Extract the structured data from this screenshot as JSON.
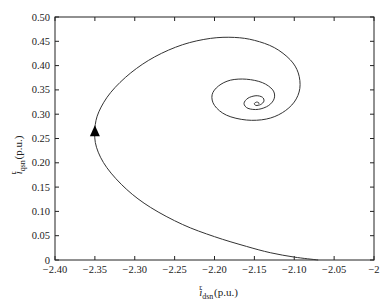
{
  "chart_data": {
    "type": "line",
    "title": "",
    "xlabel": "i^r_dsn(p.u.)",
    "xlabel_main": "i",
    "xlabel_sup": "r",
    "xlabel_sub": "dsn",
    "xlabel_unit": "(p.u.)",
    "ylabel": "i^r_qsn(p.u.)",
    "ylabel_main": "i",
    "ylabel_sup": "r",
    "ylabel_sub": "qsn",
    "ylabel_unit": "(p.u.)",
    "xlim": [
      -2.4,
      -2.0
    ],
    "ylim": [
      0,
      0.5
    ],
    "grid": false,
    "legend": null,
    "x_ticks": [
      -2.4,
      -2.35,
      -2.3,
      -2.25,
      -2.2,
      -2.15,
      -2.1,
      -2.05,
      -2.0
    ],
    "x_tick_labels": [
      "−2.40",
      "−2.35",
      "−2.30",
      "−2.25",
      "−2.20",
      "−2.15",
      "−2.10",
      "−2.05",
      "−2"
    ],
    "y_ticks": [
      0,
      0.05,
      0.1,
      0.15,
      0.2,
      0.25,
      0.3,
      0.35,
      0.4,
      0.45,
      0.5
    ],
    "y_tick_labels": [
      "0",
      "0.05",
      "0.10",
      "0.15",
      "0.20",
      "0.25",
      "0.30",
      "0.35",
      "0.40",
      "0.45",
      "0.50"
    ],
    "series": [
      {
        "name": "trajectory",
        "description": "Spiral trajectory starting near (-2.07, 0) and converging to approx (-2.145, 0.32)",
        "start_point": [
          -2.07,
          0.0
        ],
        "end_point": [
          -2.145,
          0.32
        ],
        "arrow_marker": {
          "x": -2.35,
          "y": 0.265,
          "direction": "up"
        },
        "x": [
          -2.07,
          -2.1,
          -2.13,
          -2.16,
          -2.2,
          -2.24,
          -2.28,
          -2.31,
          -2.335,
          -2.348,
          -2.35,
          -2.345,
          -2.33,
          -2.305,
          -2.275,
          -2.24,
          -2.205,
          -2.175,
          -2.15,
          -2.125,
          -2.105,
          -2.095,
          -2.093,
          -2.1,
          -2.115,
          -2.135,
          -2.16,
          -2.185,
          -2.2,
          -2.203,
          -2.195,
          -2.18,
          -2.16,
          -2.14,
          -2.127,
          -2.125,
          -2.132,
          -2.145,
          -2.158,
          -2.163,
          -2.158,
          -2.148,
          -2.14,
          -2.138,
          -2.142,
          -2.148,
          -2.15,
          -2.147,
          -2.144,
          -2.145
        ],
        "y": [
          0.0,
          0.006,
          0.015,
          0.028,
          0.048,
          0.073,
          0.108,
          0.145,
          0.19,
          0.232,
          0.27,
          0.305,
          0.345,
          0.385,
          0.418,
          0.443,
          0.456,
          0.458,
          0.452,
          0.437,
          0.412,
          0.385,
          0.353,
          0.325,
          0.303,
          0.29,
          0.288,
          0.298,
          0.318,
          0.34,
          0.358,
          0.37,
          0.372,
          0.365,
          0.35,
          0.333,
          0.318,
          0.31,
          0.312,
          0.322,
          0.333,
          0.338,
          0.335,
          0.327,
          0.32,
          0.318,
          0.322,
          0.325,
          0.323,
          0.321
        ],
        "color": "#333333"
      }
    ]
  }
}
